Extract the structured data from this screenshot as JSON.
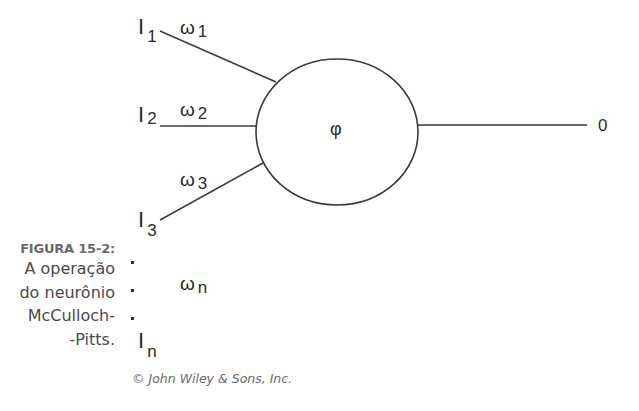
{
  "figure": {
    "label": "FIGURA 15-2:",
    "caption_lines": [
      "A operação",
      "do neurônio",
      "McCulloch-",
      "-Pitts."
    ],
    "credit": "© John Wiley & Sons, Inc."
  },
  "neuron": {
    "activation_symbol": "φ",
    "output_label": "0"
  },
  "inputs": [
    {
      "name": "I",
      "sub": "1",
      "weight": "ω",
      "weight_sub": "1"
    },
    {
      "name": "I",
      "sub": "2",
      "weight": "ω",
      "weight_sub": "2"
    },
    {
      "name": "I",
      "sub": "3",
      "weight": "ω",
      "weight_sub": "3"
    },
    {
      "name": "I",
      "sub": "n",
      "weight": "ω",
      "weight_sub": "n"
    }
  ],
  "ellipsis": ".",
  "colors": {
    "stroke": "#3a3a3a",
    "text": "#2a2a2a",
    "caption_title": "#6b6b6b"
  }
}
